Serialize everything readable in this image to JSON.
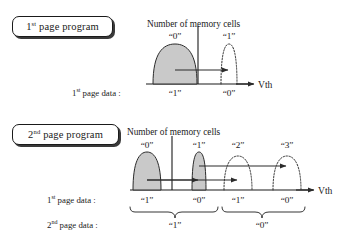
{
  "figure": {
    "background_color": "#ffffff",
    "ink_color": "#1a1a1a",
    "fill_color": "#c9c9c9"
  },
  "panels": [
    {
      "id": "first-page-program",
      "tag": {
        "prefix": "1",
        "sup": "st",
        "rest": " page program"
      },
      "axis_title": "Number of memory cells",
      "axis_x_label": "Vth",
      "distributions": [
        {
          "state": "“0”",
          "style": "filled",
          "center_x": 175,
          "half_width": 22,
          "height": 40
        },
        {
          "state": "“1”",
          "style": "dotted",
          "center_x": 229,
          "half_width": 8,
          "height": 40
        }
      ],
      "rows": [
        {
          "label": {
            "prefix": "1",
            "sup": "st",
            "rest": " page data :"
          },
          "cells": [
            {
              "value": "“1”",
              "center_x": 175
            },
            {
              "value": "“0”",
              "center_x": 229
            }
          ]
        }
      ],
      "arrows": [
        {
          "from_x": 175,
          "to_x": 229,
          "y": 70
        }
      ]
    },
    {
      "id": "second-page-program",
      "tag": {
        "prefix": "2",
        "sup": "nd",
        "rest": " page program"
      },
      "axis_title": "Number of memory cells",
      "axis_x_label": "Vth",
      "distributions": [
        {
          "state": "“0”",
          "style": "filled",
          "center_x": 147,
          "half_width": 16,
          "height": 38
        },
        {
          "state": "“1”",
          "style": "filled",
          "center_x": 199,
          "half_width": 8,
          "height": 38
        },
        {
          "state": "“2”",
          "style": "dotted",
          "center_x": 238,
          "half_width": 15,
          "height": 34
        },
        {
          "state": "“3”",
          "style": "dotted",
          "center_x": 287,
          "half_width": 15,
          "height": 34
        }
      ],
      "rows": [
        {
          "label": {
            "prefix": "1",
            "sup": "st",
            "rest": " page data :"
          },
          "cells": [
            {
              "value": "“1”",
              "center_x": 147
            },
            {
              "value": "“0”",
              "center_x": 199
            },
            {
              "value": "“1”",
              "center_x": 238
            },
            {
              "value": "“0”",
              "center_x": 287
            }
          ]
        },
        {
          "label": {
            "prefix": "2",
            "sup": "nd",
            "rest": " page data :"
          },
          "cells": [
            {
              "value": "“1”",
              "center_x": 175
            },
            {
              "value": "“0”",
              "center_x": 262
            }
          ]
        }
      ],
      "braces": [
        {
          "from_x": 130,
          "to_x": 218,
          "groups": "“1”"
        },
        {
          "from_x": 222,
          "to_x": 305,
          "groups": "“0”"
        }
      ],
      "arrows": [
        {
          "from_x": 147,
          "to_x": 199,
          "y": 180
        },
        {
          "from_x": 147,
          "to_x": 238,
          "y": 180
        },
        {
          "from_x": 199,
          "to_x": 287,
          "y": 166
        }
      ]
    }
  ]
}
